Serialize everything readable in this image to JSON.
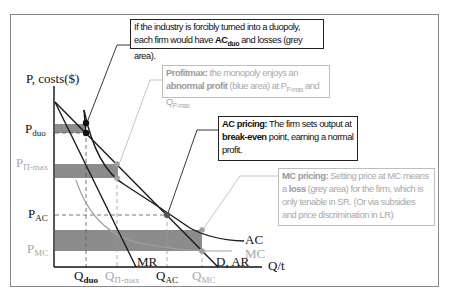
{
  "diagram": {
    "axes": {
      "y_label": "P, costs($)",
      "x_label": "Q/t"
    },
    "price_labels": {
      "p_duo": {
        "main": "P",
        "sub": "duo"
      },
      "p_pimax": {
        "main": "P",
        "sub": "Π-max"
      },
      "p_ac": {
        "main": "P",
        "sub": "AC"
      },
      "p_mc": {
        "main": "P",
        "sub": "MC"
      }
    },
    "quantity_labels": {
      "q_duo": {
        "main": "Q",
        "sub": "duo"
      },
      "q_pimax": {
        "main": "Q",
        "sub": "Π-max"
      },
      "q_ac": {
        "main": "Q",
        "sub": "AC"
      },
      "q_mc": {
        "main": "Q",
        "sub": "MC"
      }
    },
    "curve_labels": {
      "ac": "AC",
      "mc": "MC",
      "mr": "MR",
      "demand": "D, AR"
    },
    "notes": {
      "duopoly": {
        "text_1": "If the industry is forcibly turned into a duopoly, each firm would have ",
        "bold_1": "AC",
        "bold_sub": "duo",
        "text_2": " and losses (grey area)."
      },
      "profitmax": {
        "bold_1": "Profitmax:",
        "text_1": " the monopoly enjoys an ",
        "bold_2": "abnormal profit",
        "text_2": " (blue area) at P",
        "sub_1": "P-max",
        "text_3": " and Q",
        "sub_2": "P-max"
      },
      "ac_pricing": {
        "bold_1": "AC pricing:",
        "text_1": " The firm sets output at ",
        "bold_2": "break-even",
        "text_2": " point, earning a normal profit."
      },
      "mc_pricing": {
        "bold_1": "MC pricing:",
        "text_1": " Setting price at MC means a ",
        "bold_2": "loss",
        "text_2": " (grey area) for the firm, which is only tenable in SR. (Or via subsidies and price discrimination in LR)"
      }
    },
    "colors": {
      "axis": "#111111",
      "curve_dark": "#1a1a1a",
      "curve_grey": "#a0a0a0",
      "shade": "#8c8c8c",
      "frame": "#8a8a8a"
    }
  }
}
